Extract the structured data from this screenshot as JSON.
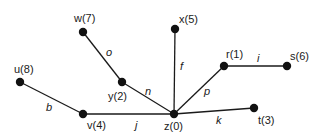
{
  "diagram": {
    "type": "tree-graph",
    "colors": {
      "ink": "#1a1a1a",
      "node": "#111111",
      "background": "#ffffff"
    },
    "nodes": [
      {
        "id": "w",
        "label": "w(7)",
        "x": 83,
        "y": 32,
        "lx": 74,
        "ly": 22
      },
      {
        "id": "x",
        "label": "x(5)",
        "x": 175,
        "y": 29,
        "lx": 179,
        "ly": 23
      },
      {
        "id": "r",
        "label": "r(1)",
        "x": 224,
        "y": 66,
        "lx": 226,
        "ly": 58
      },
      {
        "id": "s",
        "label": "s(6)",
        "x": 287,
        "y": 66,
        "lx": 290,
        "ly": 60
      },
      {
        "id": "u",
        "label": "u(8)",
        "x": 20,
        "y": 82,
        "lx": 14,
        "ly": 73
      },
      {
        "id": "y",
        "label": "y(2)",
        "x": 122,
        "y": 82,
        "lx": 108,
        "ly": 100
      },
      {
        "id": "v",
        "label": "v(4)",
        "x": 83,
        "y": 114,
        "lx": 87,
        "ly": 129
      },
      {
        "id": "z",
        "label": "z(0)",
        "x": 174,
        "y": 114,
        "lx": 164,
        "ly": 130
      },
      {
        "id": "t",
        "label": "t(3)",
        "x": 254,
        "y": 108,
        "lx": 258,
        "ly": 124
      }
    ],
    "edges": [
      {
        "from": "w",
        "to": "y",
        "label": "o",
        "lx": 106,
        "ly": 56
      },
      {
        "from": "y",
        "to": "z",
        "label": "n",
        "lx": 145,
        "ly": 95
      },
      {
        "from": "x",
        "to": "z",
        "label": "f",
        "lx": 180,
        "ly": 70
      },
      {
        "from": "r",
        "to": "z",
        "label": "p",
        "lx": 204,
        "ly": 95
      },
      {
        "from": "r",
        "to": "s",
        "label": "i",
        "lx": 257,
        "ly": 62
      },
      {
        "from": "u",
        "to": "v",
        "label": "b",
        "lx": 46,
        "ly": 111
      },
      {
        "from": "v",
        "to": "z",
        "label": "j",
        "lx": 135,
        "ly": 129
      },
      {
        "from": "z",
        "to": "t",
        "label": "k",
        "lx": 216,
        "ly": 124
      }
    ]
  }
}
